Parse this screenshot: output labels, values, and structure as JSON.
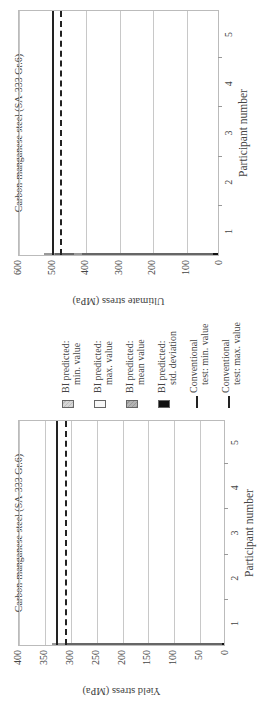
{
  "chart_data": [
    {
      "type": "bar",
      "title": "Carbon-manganese steel (SA-333 Gr.6)",
      "xlabel": "Participant number",
      "ylabel": "Yield stress (MPa)",
      "ylim": [
        0,
        400
      ],
      "yticks": [
        0,
        50,
        100,
        150,
        200,
        250,
        300,
        350,
        400
      ],
      "categories": [
        "1",
        "2",
        "3",
        "4",
        "5"
      ],
      "series": [
        {
          "name": "BI predicted: min. value",
          "values": [
            280,
            262,
            275,
            295,
            302
          ]
        },
        {
          "name": "BI predicted: max. value",
          "values": [
            308,
            332,
            305,
            313,
            315
          ]
        },
        {
          "name": "BI predicted: mean value",
          "values": [
            297,
            297,
            295,
            303,
            303
          ]
        },
        {
          "name": "BI predicted: std. deviation",
          "values": [
            12,
            25,
            8,
            8,
            4
          ]
        }
      ],
      "reference_lines": [
        {
          "name": "Conventional test: min. value",
          "value": 309,
          "style": "dashed"
        },
        {
          "name": "Conventional test: max. value",
          "value": 326,
          "style": "solid"
        }
      ],
      "grid": true
    },
    {
      "type": "bar",
      "title": "Carbon-manganese steel (SA-333 Gr.6)",
      "xlabel": "Participant number",
      "ylabel": "Ultimate stress (MPa)",
      "ylim": [
        0,
        600
      ],
      "yticks": [
        0,
        100,
        200,
        300,
        400,
        500,
        600
      ],
      "categories": [
        "1",
        "2",
        "3",
        "4",
        "5"
      ],
      "series": [
        {
          "name": "BI predicted: min. value",
          "values": [
            415,
            430,
            397,
            469,
            385
          ]
        },
        {
          "name": "BI predicted: max. value",
          "values": [
            460,
            520,
            463,
            505,
            430
          ]
        },
        {
          "name": "BI predicted: mean value",
          "values": [
            445,
            478,
            439,
            486,
            406
          ]
        },
        {
          "name": "BI predicted: std. deviation",
          "values": [
            15,
            35,
            15,
            12,
            15
          ]
        }
      ],
      "reference_lines": [
        {
          "name": "Conventional test: min. value",
          "value": 475,
          "style": "dashed"
        },
        {
          "name": "Conventional test: max. value",
          "value": 500,
          "style": "solid"
        }
      ],
      "grid": true
    }
  ],
  "legend": {
    "items": [
      {
        "line1": "BI predicted:",
        "line2": "min. value",
        "kind": "min"
      },
      {
        "line1": "BI predicted:",
        "line2": "max. value",
        "kind": "max"
      },
      {
        "line1": "BI predicted:",
        "line2": "mean value",
        "kind": "mean"
      },
      {
        "line1": "BI predicted:",
        "line2": "std. deviation",
        "kind": "sd"
      },
      {
        "line1": "Conventional",
        "line2": "test: min. value",
        "kind": "dashed"
      },
      {
        "line1": "Conventional",
        "line2": "test: max. value",
        "kind": "solid"
      }
    ]
  }
}
